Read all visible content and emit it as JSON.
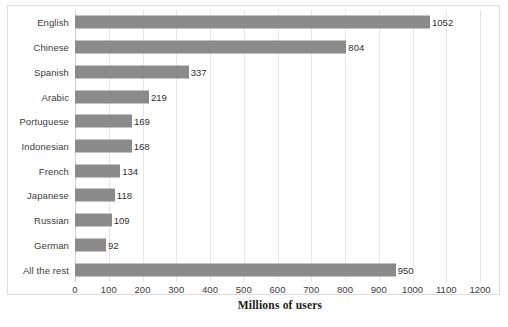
{
  "chart_data": {
    "type": "bar",
    "orientation": "horizontal",
    "title": "",
    "xlabel": "Millions of users",
    "ylabel": "",
    "xlim": [
      0,
      1200
    ],
    "xticks": [
      0,
      100,
      200,
      300,
      400,
      500,
      600,
      700,
      800,
      900,
      1000,
      1100,
      1200
    ],
    "grid": true,
    "legend": false,
    "bar_color": "#8a8a8a",
    "categories": [
      "English",
      "Chinese",
      "Spanish",
      "Arabic",
      "Portuguese",
      "Indonesian",
      "French",
      "Japanese",
      "Russian",
      "German",
      "All the rest"
    ],
    "values": [
      1052,
      804,
      337,
      219,
      169,
      168,
      134,
      118,
      109,
      92,
      950
    ],
    "data_labels": [
      "1052",
      "804",
      "337",
      "219",
      "169",
      "168",
      "134",
      "118",
      "109",
      "92",
      "950"
    ]
  }
}
